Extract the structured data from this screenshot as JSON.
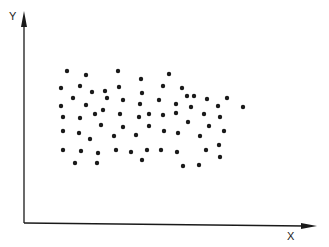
{
  "chart_data": {
    "type": "scatter",
    "title": "",
    "xlabel": "X",
    "ylabel": "Y",
    "grid": false,
    "legend": null,
    "axis_ticks": "none",
    "units": "pixel coordinates within the 329x247 figure (origin of axes at [24,223])",
    "axes": {
      "origin": [
        24,
        223
      ],
      "x_end": [
        316,
        226
      ],
      "y_end": [
        24,
        12
      ]
    },
    "points": [
      [
        67,
        71
      ],
      [
        118,
        71
      ],
      [
        86,
        75
      ],
      [
        169,
        74
      ],
      [
        141,
        79
      ],
      [
        61,
        88
      ],
      [
        80,
        86
      ],
      [
        105,
        91
      ],
      [
        119,
        87
      ],
      [
        142,
        93
      ],
      [
        163,
        86
      ],
      [
        182,
        88
      ],
      [
        92,
        92
      ],
      [
        73,
        98
      ],
      [
        107,
        98
      ],
      [
        123,
        100
      ],
      [
        159,
        100
      ],
      [
        187,
        96
      ],
      [
        194,
        96
      ],
      [
        207,
        99
      ],
      [
        227,
        98
      ],
      [
        140,
        104
      ],
      [
        176,
        104
      ],
      [
        61,
        106
      ],
      [
        86,
        105
      ],
      [
        191,
        107
      ],
      [
        218,
        106
      ],
      [
        243,
        107
      ],
      [
        103,
        110
      ],
      [
        120,
        114
      ],
      [
        95,
        114
      ],
      [
        149,
        114
      ],
      [
        163,
        115
      ],
      [
        176,
        113
      ],
      [
        204,
        114
      ],
      [
        220,
        117
      ],
      [
        139,
        117
      ],
      [
        63,
        117
      ],
      [
        80,
        118
      ],
      [
        101,
        125
      ],
      [
        123,
        127
      ],
      [
        149,
        126
      ],
      [
        188,
        122
      ],
      [
        209,
        126
      ],
      [
        63,
        131
      ],
      [
        79,
        133
      ],
      [
        90,
        139
      ],
      [
        114,
        136
      ],
      [
        136,
        135
      ],
      [
        164,
        131
      ],
      [
        178,
        133
      ],
      [
        224,
        131
      ],
      [
        200,
        136
      ],
      [
        219,
        145
      ],
      [
        63,
        150
      ],
      [
        81,
        151
      ],
      [
        98,
        153
      ],
      [
        116,
        150
      ],
      [
        131,
        152
      ],
      [
        147,
        150
      ],
      [
        161,
        150
      ],
      [
        177,
        152
      ],
      [
        206,
        150
      ],
      [
        75,
        163
      ],
      [
        97,
        163
      ],
      [
        142,
        160
      ],
      [
        220,
        157
      ],
      [
        183,
        166
      ],
      [
        199,
        165
      ]
    ],
    "point_color": "#1a1a1a",
    "point_radius": 2.2
  },
  "labels": {
    "x": "X",
    "y": "Y"
  }
}
